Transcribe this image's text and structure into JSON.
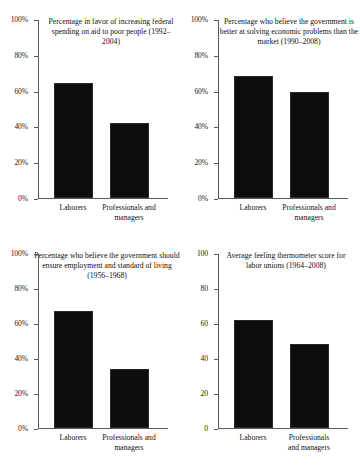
{
  "figure": {
    "background": "#ffffff",
    "bar_color": "#0d0d0d",
    "axis_color": "#5a5a5a"
  },
  "chart_data": [
    {
      "id": "panel-1",
      "type": "bar",
      "title": "Percentage in favor of increasing federal spending on aid to poor people (1992–2004)",
      "categories": [
        "Laborers",
        "Professionals and\nmanagers"
      ],
      "values": [
        64,
        42
      ],
      "xlabel": "",
      "ylabel": "",
      "ylim": [
        0,
        100
      ],
      "yticks": [
        0,
        20,
        40,
        60,
        80,
        100
      ],
      "ytick_labels": [
        "0%",
        "20%",
        "40%",
        "60%",
        "80%",
        "100%"
      ],
      "grid": false,
      "legend": "none"
    },
    {
      "id": "panel-2",
      "type": "bar",
      "title": "Percentage who believe the government is better at solving economic problems than the market (1990–2008)",
      "categories": [
        "Laborers",
        "Professionals and\nmanagers"
      ],
      "values": [
        68,
        59
      ],
      "xlabel": "",
      "ylabel": "",
      "ylim": [
        0,
        100
      ],
      "yticks": [
        0,
        20,
        40,
        60,
        80,
        100
      ],
      "ytick_labels": [
        "0%",
        "20%",
        "40%",
        "60%",
        "80%",
        "100%"
      ],
      "grid": false,
      "legend": "none"
    },
    {
      "id": "panel-3",
      "type": "bar",
      "title": "Percentage who believe the government should ensure employment and standard of living (1956–1968)",
      "categories": [
        "Laborers",
        "Professionals and\nmanagers"
      ],
      "values": [
        67,
        34
      ],
      "xlabel": "",
      "ylabel": "",
      "ylim": [
        0,
        100
      ],
      "yticks": [
        0,
        20,
        40,
        60,
        80,
        100
      ],
      "ytick_labels": [
        "0%",
        "20%",
        "40%",
        "60%",
        "80%",
        "100%"
      ],
      "grid": false,
      "legend": "none"
    },
    {
      "id": "panel-4",
      "type": "bar",
      "title": "Average feeling thermometer score for labor unions (1964–2008)",
      "categories": [
        "Laborers",
        "Professionals\nand managers"
      ],
      "values": [
        62,
        48
      ],
      "xlabel": "",
      "ylabel": "",
      "ylim": [
        0,
        100
      ],
      "yticks": [
        0,
        20,
        40,
        60,
        80,
        100
      ],
      "ytick_labels": [
        "0",
        "20",
        "40",
        "60",
        "80",
        "100"
      ],
      "grid": false,
      "legend": "none"
    }
  ]
}
